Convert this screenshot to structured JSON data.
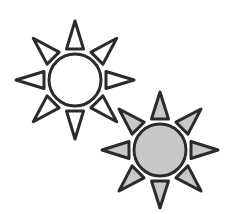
{
  "canvas": {
    "width": 233,
    "height": 214,
    "background_color": "#ffffff",
    "title": "two-sun-brightness-icons"
  },
  "style": {
    "stroke_color": "#2b2b2b",
    "stroke_width": 3,
    "outline_fill": "#ffffff",
    "gray_fill": "#c8c8c8",
    "ray_count": 8,
    "ray_angles_deg": [
      0,
      45,
      90,
      135,
      180,
      225,
      270,
      315
    ]
  },
  "icons": [
    {
      "id": "sun-outline",
      "label": "Sun outline icon",
      "variant": "outline",
      "center_x": 75,
      "center_y": 80,
      "circle_radius": 26,
      "ray_inner_radius": 31,
      "ray_outer_radius": 59,
      "ray_half_width": 8.5,
      "circle_fill": "#ffffff",
      "ray_fill": "#ffffff",
      "stroke_color": "#2b2b2b",
      "stroke_width": 3,
      "z_order": 1
    },
    {
      "id": "sun-filled",
      "label": "Sun filled gray icon",
      "variant": "filled",
      "center_x": 160,
      "center_y": 150,
      "circle_radius": 26,
      "ray_inner_radius": 31,
      "ray_outer_radius": 58,
      "ray_half_width": 8.5,
      "circle_fill": "#c8c8c8",
      "ray_fill": "#c8c8c8",
      "stroke_color": "#2b2b2b",
      "stroke_width": 3,
      "z_order": 2
    }
  ]
}
